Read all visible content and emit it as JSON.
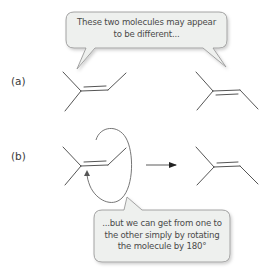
{
  "labels": {
    "a": "(a)",
    "b": "(b)"
  },
  "callouts": {
    "top": {
      "line1": "These two molecules may appear",
      "line2": "to be different..."
    },
    "bottom": {
      "line1": "...but we can get from one to",
      "line2": "the other simply by rotating",
      "line3": "the molecule by 180°"
    }
  },
  "molecules": {
    "row_a": [
      "2-methylbut-2-ene (left orientation)",
      "2-methylbut-2-ene (right orientation)"
    ],
    "row_b": [
      "2-methylbut-2-ene (before rotation)",
      "2-methylbut-2-ene (after 180° rotation)"
    ]
  },
  "colors": {
    "bond": "#555555",
    "bubble_fill": "#eef0ee",
    "bubble_stroke": "#9a9a9a",
    "text": "#4a4a4a"
  }
}
